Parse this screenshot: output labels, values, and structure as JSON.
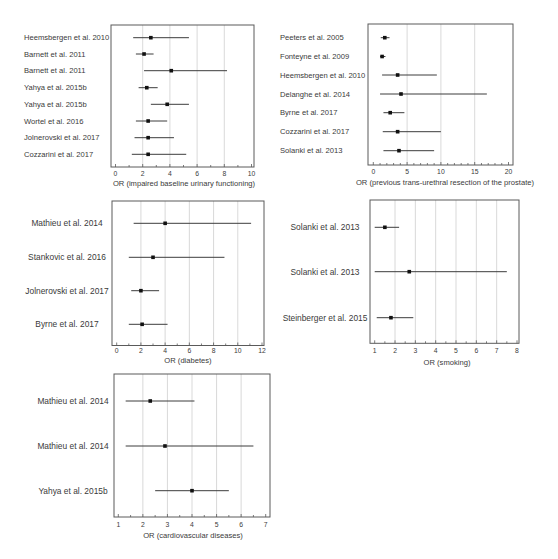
{
  "chart_data": [
    {
      "type": "forest",
      "title": "",
      "xlabel": "OR (impaired baseline urinary functioning)",
      "ylabel": "",
      "xlim": [
        0,
        10
      ],
      "ticks": [
        0,
        2,
        4,
        6,
        8,
        10
      ],
      "grid": true,
      "rows": [
        {
          "study": "Heemsbergen et al. 2010",
          "or": 2.6,
          "ci_low": 1.3,
          "ci_high": 5.4
        },
        {
          "study": "Barnett et al. 2011",
          "or": 2.1,
          "ci_low": 1.5,
          "ci_high": 2.8
        },
        {
          "study": "Barnett et al. 2011",
          "or": 4.1,
          "ci_low": 2.1,
          "ci_high": 8.2
        },
        {
          "study": "Yahya et al. 2015b",
          "or": 2.3,
          "ci_low": 1.7,
          "ci_high": 3.1
        },
        {
          "study": "Yahya et al. 2015b",
          "or": 3.8,
          "ci_low": 2.6,
          "ci_high": 5.4
        },
        {
          "study": "Wortel et al. 2016",
          "or": 2.4,
          "ci_low": 1.5,
          "ci_high": 3.8
        },
        {
          "study": "Jolnerovski et al. 2017",
          "or": 2.4,
          "ci_low": 1.4,
          "ci_high": 4.3
        },
        {
          "study": "Cozzarini et al. 2017",
          "or": 2.4,
          "ci_low": 1.2,
          "ci_high": 5.2
        }
      ]
    },
    {
      "type": "forest",
      "title": "",
      "xlabel": "OR (previous trans-urethral resection of the prostate)",
      "ylabel": "",
      "xlim": [
        0,
        20
      ],
      "ticks": [
        0,
        5,
        10,
        15,
        20
      ],
      "grid": true,
      "rows": [
        {
          "study": "Peeters et al. 2005",
          "or": 1.7,
          "ci_low": 1.1,
          "ci_high": 2.4
        },
        {
          "study": "Fonteyne et al. 2009",
          "or": 1.3,
          "ci_low": 1.0,
          "ci_high": 1.8
        },
        {
          "study": "Heemsbergen et al. 2010",
          "or": 3.6,
          "ci_low": 1.3,
          "ci_high": 9.4
        },
        {
          "study": "Delanghe et al. 2014",
          "or": 4.1,
          "ci_low": 1.0,
          "ci_high": 16.8
        },
        {
          "study": "Byrne et al. 2017",
          "or": 2.5,
          "ci_low": 1.5,
          "ci_high": 4.6
        },
        {
          "study": "Cozzarini et al. 2017",
          "or": 3.6,
          "ci_low": 1.4,
          "ci_high": 10.0
        },
        {
          "study": "Solanki et al. 2013",
          "or": 3.8,
          "ci_low": 1.5,
          "ci_high": 9.0
        }
      ]
    },
    {
      "type": "forest",
      "title": "",
      "xlabel": "OR (diabetes)",
      "ylabel": "",
      "xlim": [
        0,
        12
      ],
      "ticks": [
        0,
        2,
        4,
        6,
        8,
        10,
        12
      ],
      "grid": true,
      "rows": [
        {
          "study": "Mathieu et al. 2014",
          "or": 4.0,
          "ci_low": 1.4,
          "ci_high": 11.1
        },
        {
          "study": "Stankovic et al. 2016",
          "or": 3.0,
          "ci_low": 1.0,
          "ci_high": 8.9
        },
        {
          "study": "Jolnerovski et al. 2017",
          "or": 2.0,
          "ci_low": 1.2,
          "ci_high": 3.5
        },
        {
          "study": "Byrne et al. 2017",
          "or": 2.1,
          "ci_low": 1.0,
          "ci_high": 4.2
        }
      ]
    },
    {
      "type": "forest",
      "title": "",
      "xlabel": "OR (smoking)",
      "ylabel": "",
      "xlim": [
        1,
        8
      ],
      "ticks": [
        1,
        2,
        3,
        4,
        5,
        6,
        7,
        8
      ],
      "grid": true,
      "rows": [
        {
          "study": "Solanki et al. 2013",
          "or": 1.5,
          "ci_low": 1.0,
          "ci_high": 2.2
        },
        {
          "study": "Solanki et al. 2013",
          "or": 2.7,
          "ci_low": 1.0,
          "ci_high": 7.5
        },
        {
          "study": "Steinberger et al. 2015",
          "or": 1.8,
          "ci_low": 1.1,
          "ci_high": 2.9
        }
      ]
    },
    {
      "type": "forest",
      "title": "",
      "xlabel": "OR (cardiovascular diseases)",
      "ylabel": "",
      "xlim": [
        1,
        7
      ],
      "ticks": [
        1,
        2,
        3,
        4,
        5,
        6,
        7
      ],
      "grid": true,
      "rows": [
        {
          "study": "Mathieu et al. 2014",
          "or": 2.3,
          "ci_low": 1.3,
          "ci_high": 4.1
        },
        {
          "study": "Mathieu et al. 2014",
          "or": 2.9,
          "ci_low": 1.3,
          "ci_high": 6.5
        },
        {
          "study": "Yahya et al. 2015b",
          "or": 4.0,
          "ci_low": 2.5,
          "ci_high": 5.5
        }
      ]
    }
  ]
}
